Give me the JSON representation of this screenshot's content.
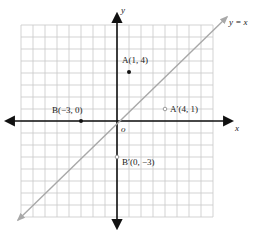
{
  "chart_data": {
    "type": "scatter",
    "title": "",
    "xlabel": "x",
    "ylabel": "y",
    "origin_label": "o",
    "xlim": [
      -8,
      8
    ],
    "ylim": [
      -8,
      8
    ],
    "grid": true,
    "grid_step": 1,
    "lines": [
      {
        "name": "y = x",
        "label": "y = x",
        "slope": 1,
        "intercept": 0,
        "color": "#a8a8a8"
      }
    ],
    "points": [
      {
        "name": "A",
        "label": "A(1, 4)",
        "x": 1,
        "y": 4,
        "style": "filled"
      },
      {
        "name": "B",
        "label": "B(−3, 0)",
        "x": -3,
        "y": 0,
        "style": "filled"
      },
      {
        "name": "A'",
        "label": "A′(4, 1)",
        "x": 4,
        "y": 1,
        "style": "hollow"
      },
      {
        "name": "B'",
        "label": "B′(0, −3)",
        "x": 0,
        "y": -3,
        "style": "hollow"
      }
    ]
  },
  "labels": {
    "x_axis": "x",
    "y_axis": "y",
    "origin": "o",
    "line_yx": "y = x",
    "point_a": "A(1, 4)",
    "point_b": "B(−3, 0)",
    "point_a_prime": "A′(4, 1)",
    "point_b_prime": "B′(0, −3)"
  },
  "colors": {
    "grid": "#c8c8c8",
    "axis": "#111111",
    "reflection_line": "#a8a8a8",
    "point": "#111111",
    "hollow_point": "#9a9a9a"
  }
}
